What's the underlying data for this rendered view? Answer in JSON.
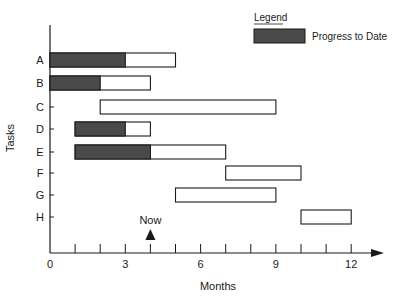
{
  "chart_data": {
    "type": "gantt",
    "title": "",
    "xlabel": "Months",
    "ylabel": "Tasks",
    "xlim": [
      0,
      13
    ],
    "x_ticks": [
      0,
      1,
      2,
      3,
      4,
      5,
      6,
      7,
      8,
      9,
      10,
      11,
      12
    ],
    "x_tick_labels": [
      "0",
      "3",
      "6",
      "9",
      "12"
    ],
    "x_tick_label_values": [
      0,
      3,
      6,
      9,
      12
    ],
    "categories": [
      "A",
      "B",
      "C",
      "D",
      "E",
      "F",
      "G",
      "H"
    ],
    "tasks": [
      {
        "name": "A",
        "start": 0,
        "end": 5,
        "progress_end": 3
      },
      {
        "name": "B",
        "start": 0,
        "end": 4,
        "progress_end": 2
      },
      {
        "name": "C",
        "start": 2,
        "end": 9,
        "progress_end": null
      },
      {
        "name": "D",
        "start": 1,
        "end": 4,
        "progress_end": 3
      },
      {
        "name": "E",
        "start": 1,
        "end": 7,
        "progress_end": 4
      },
      {
        "name": "F",
        "start": 7,
        "end": 10,
        "progress_end": null
      },
      {
        "name": "G",
        "start": 5,
        "end": 9,
        "progress_end": null
      },
      {
        "name": "H",
        "start": 10,
        "end": 12,
        "progress_end": null
      }
    ],
    "annotations": [
      {
        "text": "Now",
        "x": 4,
        "marker": "triangle-up"
      }
    ],
    "legend": {
      "title": "Legend",
      "entries": [
        {
          "label": "Progress to Date",
          "color": "#4a4a4a"
        }
      ],
      "position": "top-right"
    },
    "grid": false
  },
  "colors": {
    "progress": "#4a4a4a",
    "bar_fill": "#ffffff",
    "outline": "#1a1a1a"
  }
}
